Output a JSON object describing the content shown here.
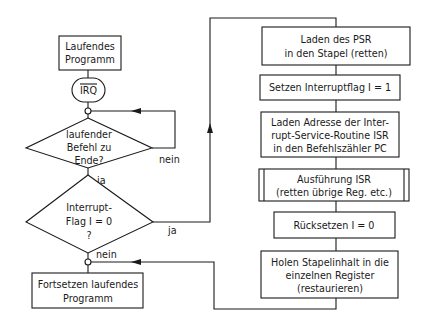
{
  "diagram": {
    "type": "flowchart",
    "language": "de",
    "left_column": {
      "start_box": {
        "lines": [
          "Laufendes",
          "Programm"
        ]
      },
      "terminator": {
        "label": "IRQ",
        "overline": true
      },
      "decision_1": {
        "lines": [
          "laufender",
          "Befehl  zu",
          "Ende?"
        ],
        "no_label": "nein",
        "yes_label": "ja"
      },
      "decision_2": {
        "lines": [
          "Interrupt-",
          "Flag  I = 0",
          "?"
        ],
        "yes_label": "ja",
        "no_label": "nein"
      },
      "end_box": {
        "lines": [
          "Fortsetzen  laufendes",
          "Programm"
        ]
      }
    },
    "right_column": {
      "steps": [
        {
          "id": "push-psr",
          "lines": [
            "Laden des  PSR",
            "in  den  Stapel  (retten)"
          ]
        },
        {
          "id": "set-flag",
          "lines": [
            "Setzen  Interruptflag  I  =  1"
          ]
        },
        {
          "id": "load-isr-address",
          "lines": [
            "Laden  Adresse  der  Inter-",
            "rupt-Service-Routine  ISR",
            "in  den  Befehlszähler  PC"
          ]
        },
        {
          "id": "execute-isr",
          "lines": [
            "Ausführung  ISR",
            "(retten  übrige  Reg.  etc.)"
          ],
          "subroutine": true
        },
        {
          "id": "reset-flag",
          "lines": [
            "Rücksetzen  I  =  0"
          ]
        },
        {
          "id": "restore-registers",
          "lines": [
            "Holen  Stapelinhalt  in  die",
            "einzelnen  Register",
            "(restaurieren)"
          ]
        }
      ]
    }
  }
}
